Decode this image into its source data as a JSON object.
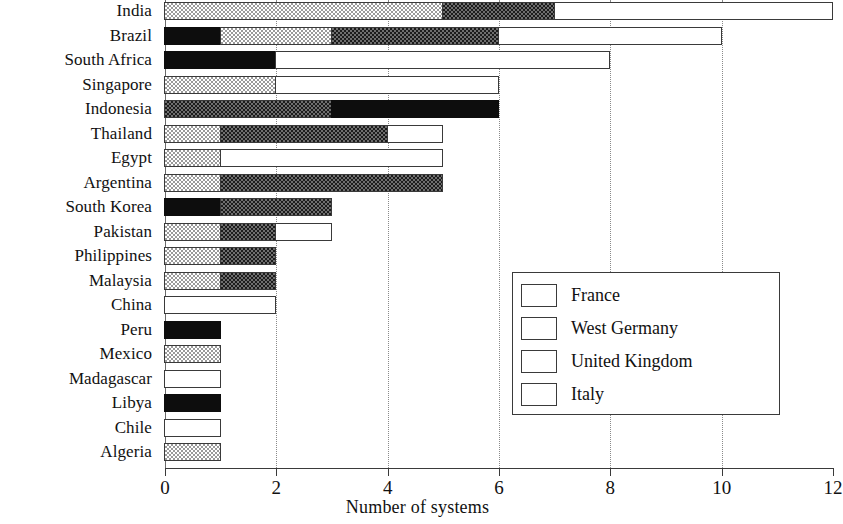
{
  "chart_data": {
    "type": "bar",
    "orientation": "horizontal",
    "stacked": true,
    "title": "",
    "xlabel": "Number of systems",
    "ylabel": "",
    "xlim": [
      0,
      12
    ],
    "xticks": [
      0,
      2,
      4,
      6,
      8,
      10,
      12
    ],
    "xtick_labels": [
      "0",
      "2",
      "4",
      "6",
      "8",
      "10",
      "12"
    ],
    "grid": "vertical dotted at 2, 4, 6, 8, 10",
    "legend_position": "center-right",
    "categories": [
      "India",
      "Brazil",
      "South Africa",
      "Singapore",
      "Indonesia",
      "Thailand",
      "Egypt",
      "Argentina",
      "South Korea",
      "Pakistan",
      "Philippines",
      "Malaysia",
      "China",
      "Peru",
      "Mexico",
      "Madagascar",
      "Libya",
      "Chile",
      "Algeria"
    ],
    "series": [
      {
        "name": "France",
        "color": "#ffffff",
        "pattern": "solid-white",
        "values": [
          5,
          4,
          6,
          4,
          0,
          1,
          4,
          0,
          0,
          1,
          0,
          0,
          2,
          0,
          0,
          1,
          0,
          1,
          0
        ]
      },
      {
        "name": "West Germany",
        "color": "#4a4a4a",
        "pattern": "dark-checker",
        "values": [
          2,
          3,
          0,
          0,
          3,
          3,
          0,
          4,
          2,
          1,
          1,
          1,
          0,
          0,
          0,
          0,
          0,
          0,
          0
        ]
      },
      {
        "name": "United Kingdom",
        "color": "#c8c8c8",
        "pattern": "light-checker",
        "values": [
          5,
          2,
          0,
          2,
          0,
          1,
          1,
          1,
          0,
          1,
          1,
          1,
          0,
          0,
          1,
          0,
          0,
          0,
          1
        ]
      },
      {
        "name": "Italy",
        "color": "#0d0d0d",
        "pattern": "solid-black",
        "values": [
          0,
          1,
          2,
          0,
          3,
          0,
          0,
          0,
          1,
          0,
          0,
          0,
          0,
          1,
          0,
          0,
          1,
          0,
          0
        ]
      }
    ],
    "stack_order": [
      "Italy",
      "United Kingdom",
      "West Germany",
      "France"
    ],
    "totals": [
      12,
      10,
      8,
      6,
      6,
      5,
      5,
      5,
      3,
      3,
      2,
      2,
      2,
      1,
      1,
      1,
      1,
      1,
      1
    ],
    "segments": [
      [
        [
          "United Kingdom",
          0,
          5
        ],
        [
          "West Germany",
          5,
          7
        ],
        [
          "France",
          7,
          12
        ]
      ],
      [
        [
          "Italy",
          0,
          1
        ],
        [
          "United Kingdom",
          1,
          3
        ],
        [
          "West Germany",
          3,
          6
        ],
        [
          "France",
          6,
          10
        ]
      ],
      [
        [
          "Italy",
          0,
          2
        ],
        [
          "France",
          2,
          8
        ]
      ],
      [
        [
          "United Kingdom",
          0,
          2
        ],
        [
          "France",
          2,
          6
        ]
      ],
      [
        [
          "West Germany",
          0,
          3
        ],
        [
          "Italy",
          3,
          6
        ]
      ],
      [
        [
          "United Kingdom",
          0,
          1
        ],
        [
          "West Germany",
          1,
          4
        ],
        [
          "France",
          4,
          5
        ]
      ],
      [
        [
          "United Kingdom",
          0,
          1
        ],
        [
          "France",
          1,
          5
        ]
      ],
      [
        [
          "United Kingdom",
          0,
          1
        ],
        [
          "West Germany",
          1,
          5
        ]
      ],
      [
        [
          "Italy",
          0,
          1
        ],
        [
          "West Germany",
          1,
          3
        ]
      ],
      [
        [
          "United Kingdom",
          0,
          1
        ],
        [
          "West Germany",
          1,
          2
        ],
        [
          "France",
          2,
          3
        ]
      ],
      [
        [
          "United Kingdom",
          0,
          1
        ],
        [
          "West Germany",
          1,
          2
        ]
      ],
      [
        [
          "United Kingdom",
          0,
          1
        ],
        [
          "West Germany",
          1,
          2
        ]
      ],
      [
        [
          "France",
          0,
          2
        ]
      ],
      [
        [
          "Italy",
          0,
          1
        ]
      ],
      [
        [
          "United Kingdom",
          0,
          1
        ]
      ],
      [
        [
          "France",
          0,
          1
        ]
      ],
      [
        [
          "Italy",
          0,
          1
        ]
      ],
      [
        [
          "France",
          0,
          1
        ]
      ],
      [
        [
          "United Kingdom",
          0,
          1
        ]
      ]
    ],
    "legend": [
      {
        "label": "France",
        "key": "france"
      },
      {
        "label": "West Germany",
        "key": "wg"
      },
      {
        "label": "United Kingdom",
        "key": "uk"
      },
      {
        "label": "Italy",
        "key": "italy"
      }
    ]
  }
}
